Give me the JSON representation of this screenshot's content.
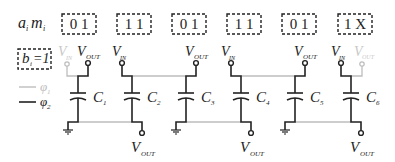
{
  "row_label": {
    "main": "a",
    "sub1": "i",
    "main2": "m",
    "sub2": "i"
  },
  "condition": {
    "main": "b",
    "sub": "i",
    "rest": "=1"
  },
  "codes": [
    {
      "value": "0 1",
      "x": 42
    },
    {
      "value": "1 1",
      "x": 97
    },
    {
      "value": "0 1",
      "x": 152
    },
    {
      "value": "1 1",
      "x": 207
    },
    {
      "value": "0 1",
      "x": 262
    },
    {
      "value": "1 X",
      "x": 318
    }
  ],
  "legend": [
    {
      "name": "phi1",
      "symbol": "φ",
      "sub": "1",
      "color": "#bdbdbd"
    },
    {
      "name": "phi2",
      "symbol": "φ",
      "sub": "2",
      "color": "#222222"
    }
  ],
  "capacitors": [
    {
      "label": "C",
      "sub": "1"
    },
    {
      "label": "C",
      "sub": "2"
    },
    {
      "label": "C",
      "sub": "3"
    },
    {
      "label": "C",
      "sub": "4"
    },
    {
      "label": "C",
      "sub": "5"
    },
    {
      "label": "C",
      "sub": "6"
    }
  ],
  "terminals": {
    "vin": {
      "main": "V",
      "sub": "IN"
    },
    "vout": {
      "main": "V",
      "sub": "OUT"
    }
  },
  "colors": {
    "phi1": "#bdbdbd",
    "phi2": "#222222",
    "text": "#222222"
  }
}
